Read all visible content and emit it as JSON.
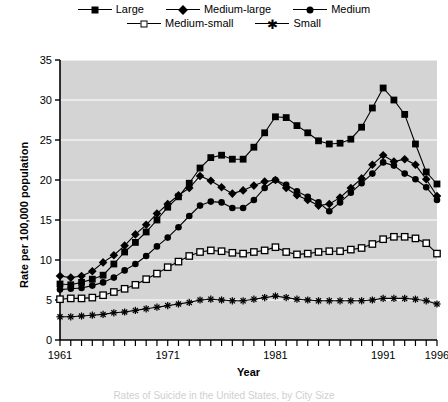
{
  "figure": {
    "caption": "Rates of Suicide in the United States, by City Size"
  },
  "legend": {
    "position": "top",
    "rows": [
      [
        {
          "label": "Large",
          "marker": "filled-square"
        },
        {
          "label": "Medium-large",
          "marker": "filled-diamond"
        },
        {
          "label": "Medium",
          "marker": "filled-circle"
        }
      ],
      [
        {
          "label": "Medium-small",
          "marker": "open-square"
        },
        {
          "label": "Small",
          "marker": "star"
        }
      ]
    ]
  },
  "axes": {
    "x": {
      "label": "Year",
      "min": 1961,
      "max": 1996,
      "tick_step": 1,
      "labeled_ticks": [
        "1961",
        "1971",
        "1981",
        "1991",
        "1996"
      ],
      "labeled_tick_values": [
        1961,
        1971,
        1981,
        1991,
        1996
      ]
    },
    "y": {
      "label": "Rate per 100,000 population",
      "min": 0,
      "max": 35,
      "tick_step": 5,
      "labeled_ticks": [
        "0",
        "5",
        "10",
        "15",
        "20",
        "25",
        "30",
        "35"
      ],
      "labeled_tick_values": [
        0,
        5,
        10,
        15,
        20,
        25,
        30,
        35
      ]
    }
  },
  "style": {
    "plot_background": "#d4d4d4",
    "gridline_color": "#ffffff",
    "axis_color": "#000000",
    "series_color": "#000000"
  },
  "chart_data": {
    "type": "line",
    "title": "",
    "subtitle": "",
    "xlabel": "Year",
    "ylabel": "Rate per 100,000 population",
    "xlim": [
      1961,
      1996
    ],
    "ylim": [
      0,
      35
    ],
    "grid": true,
    "legend_position": "top",
    "x": [
      1961,
      1962,
      1963,
      1964,
      1965,
      1966,
      1967,
      1968,
      1969,
      1970,
      1971,
      1972,
      1973,
      1974,
      1975,
      1976,
      1977,
      1978,
      1979,
      1980,
      1981,
      1982,
      1983,
      1984,
      1985,
      1986,
      1987,
      1988,
      1989,
      1990,
      1991,
      1992,
      1993,
      1994,
      1995,
      1996
    ],
    "series": [
      {
        "name": "Large",
        "marker": "filled-square",
        "values": [
          7.0,
          6.9,
          7.2,
          7.6,
          8.1,
          9.5,
          11.0,
          12.2,
          13.5,
          15.0,
          16.6,
          17.9,
          19.6,
          21.5,
          22.8,
          23.1,
          22.6,
          22.6,
          24.1,
          25.9,
          27.9,
          27.8,
          26.8,
          25.9,
          24.9,
          24.5,
          24.6,
          25.1,
          26.6,
          29.0,
          31.5,
          30.0,
          28.2,
          24.5,
          21.0,
          19.5
        ]
      },
      {
        "name": "Medium-large",
        "marker": "filled-diamond",
        "values": [
          8.0,
          7.8,
          8.0,
          8.6,
          9.7,
          10.6,
          11.8,
          13.2,
          14.4,
          15.8,
          17.0,
          18.1,
          19.0,
          20.5,
          19.9,
          19.1,
          18.3,
          18.7,
          19.3,
          19.8,
          20.0,
          19.0,
          18.1,
          17.5,
          16.8,
          17.0,
          17.8,
          19.0,
          20.2,
          21.9,
          23.1,
          22.3,
          22.6,
          21.9,
          20.1,
          18.0
        ]
      },
      {
        "name": "Medium",
        "marker": "filled-circle",
        "values": [
          6.3,
          6.4,
          6.5,
          6.8,
          7.2,
          7.8,
          8.7,
          9.5,
          10.5,
          11.7,
          12.8,
          14.1,
          15.5,
          16.8,
          17.3,
          17.2,
          16.5,
          16.5,
          17.5,
          19.0,
          20.0,
          19.4,
          18.6,
          17.9,
          17.2,
          16.1,
          17.2,
          18.4,
          19.6,
          20.8,
          22.2,
          21.8,
          20.8,
          20.1,
          19.1,
          17.5
        ]
      },
      {
        "name": "Medium-small",
        "marker": "open-square",
        "values": [
          5.1,
          5.2,
          5.2,
          5.3,
          5.6,
          6.0,
          6.4,
          6.9,
          7.6,
          8.3,
          9.1,
          9.8,
          10.5,
          11.0,
          11.2,
          11.1,
          10.9,
          10.8,
          11.0,
          11.2,
          11.6,
          11.0,
          10.7,
          10.8,
          11.0,
          11.1,
          11.1,
          11.3,
          11.5,
          12.0,
          12.6,
          12.9,
          12.9,
          12.7,
          12.1,
          10.8
        ]
      },
      {
        "name": "Small",
        "marker": "star",
        "values": [
          2.9,
          2.9,
          3.0,
          3.1,
          3.2,
          3.4,
          3.5,
          3.7,
          3.9,
          4.1,
          4.3,
          4.5,
          4.7,
          5.0,
          5.1,
          5.0,
          4.9,
          4.9,
          5.1,
          5.3,
          5.5,
          5.3,
          5.1,
          5.0,
          4.9,
          4.9,
          4.9,
          4.9,
          4.9,
          5.0,
          5.2,
          5.2,
          5.2,
          5.1,
          4.9,
          4.5
        ]
      }
    ]
  }
}
